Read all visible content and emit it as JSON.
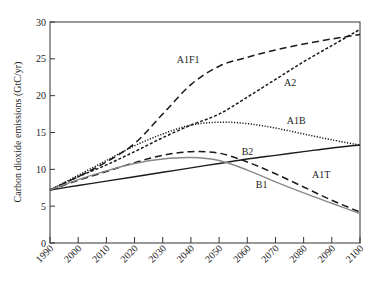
{
  "chart_data": {
    "type": "line",
    "title": "",
    "xlabel": "",
    "ylabel": "Carbon dioxide emissions (GtC/yr)",
    "xlim": [
      1990,
      2100
    ],
    "ylim": [
      0,
      30
    ],
    "grid": false,
    "legend_position": "inline labels",
    "x_ticks": [
      1990,
      2000,
      2010,
      2020,
      2030,
      2040,
      2050,
      2060,
      2070,
      2080,
      2090,
      2100
    ],
    "y_ticks": [
      0,
      5,
      10,
      15,
      20,
      25,
      30
    ],
    "x": [
      1990,
      2000,
      2010,
      2020,
      2030,
      2040,
      2050,
      2060,
      2070,
      2080,
      2090,
      2100
    ],
    "series": [
      {
        "name": "A1F1",
        "style": "long-dash",
        "color": "#1a1a1a",
        "values": [
          7.2,
          9.0,
          11.0,
          13.5,
          17.5,
          21.5,
          24.0,
          25.2,
          26.2,
          27.0,
          27.7,
          28.3
        ],
        "label_pos": [
          2035,
          24.5
        ]
      },
      {
        "name": "A2",
        "style": "short-dash",
        "color": "#1a1a1a",
        "values": [
          7.2,
          9.0,
          10.6,
          12.4,
          14.3,
          16.0,
          17.5,
          19.8,
          22.2,
          24.6,
          26.8,
          29.0
        ],
        "label_pos": [
          2073,
          21.3
        ]
      },
      {
        "name": "A1B",
        "style": "dotted",
        "color": "#1a1a1a",
        "values": [
          7.2,
          9.2,
          11.2,
          13.2,
          14.8,
          16.0,
          16.4,
          16.2,
          15.6,
          14.8,
          14.0,
          13.3
        ],
        "label_pos": [
          2074,
          16.2
        ]
      },
      {
        "name": "B2",
        "style": "solid",
        "color": "#1a1a1a",
        "values": [
          7.2,
          7.8,
          8.4,
          9.0,
          9.6,
          10.2,
          10.8,
          11.4,
          11.9,
          12.4,
          12.9,
          13.3
        ],
        "label_pos": [
          2058,
          12.0
        ]
      },
      {
        "name": "A1T",
        "style": "long-dash",
        "color": "#1a1a1a",
        "values": [
          7.2,
          8.5,
          9.7,
          10.9,
          11.9,
          12.4,
          12.2,
          11.0,
          9.4,
          7.6,
          5.8,
          4.2
        ],
        "label_pos": [
          2083,
          8.8
        ]
      },
      {
        "name": "B1",
        "style": "solid",
        "color": "#888888",
        "values": [
          7.2,
          8.6,
          9.8,
          10.8,
          11.4,
          11.6,
          11.2,
          9.9,
          8.3,
          6.8,
          5.4,
          4.0
        ],
        "label_pos": [
          2063,
          7.4
        ]
      }
    ]
  }
}
